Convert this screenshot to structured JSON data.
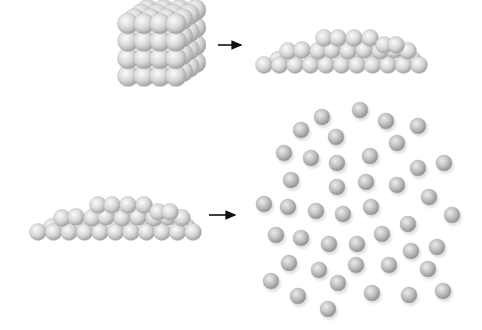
{
  "diagram": {
    "colors": {
      "background": "#ffffff",
      "sphere_light": "#f4f4f4",
      "sphere_mid": "#c8c8c8",
      "sphere_dark": "#8c8c8c",
      "arrow": "#111111"
    },
    "panels": [
      {
        "id": "solid",
        "label": "solid",
        "bbox": [
          118,
          12,
          84,
          74
        ]
      },
      {
        "id": "liquid_top",
        "label": "liquid",
        "bbox": [
          256,
          30,
          166,
          44
        ]
      },
      {
        "id": "liquid_bottom",
        "label": "liquid",
        "bbox": [
          30,
          195,
          165,
          45
        ]
      },
      {
        "id": "gas",
        "label": "gas",
        "bbox": [
          258,
          100,
          200,
          218
        ]
      }
    ],
    "arrows": [
      {
        "id": "solid-to-liquid",
        "x1": 218,
        "y1": 45,
        "x2": 245,
        "y2": 45
      },
      {
        "id": "liquid-to-gas",
        "x1": 209,
        "y1": 215,
        "x2": 239,
        "y2": 215
      }
    ],
    "gas_particles": [
      [
        322,
        117
      ],
      [
        360,
        110
      ],
      [
        386,
        121
      ],
      [
        418,
        126
      ],
      [
        301,
        130
      ],
      [
        336,
        137
      ],
      [
        397,
        143
      ],
      [
        284,
        153
      ],
      [
        311,
        158
      ],
      [
        337,
        163
      ],
      [
        370,
        156
      ],
      [
        444,
        163
      ],
      [
        418,
        168
      ],
      [
        291,
        180
      ],
      [
        337,
        187
      ],
      [
        366,
        182
      ],
      [
        397,
        185
      ],
      [
        429,
        197
      ],
      [
        264,
        204
      ],
      [
        288,
        207
      ],
      [
        316,
        211
      ],
      [
        343,
        214
      ],
      [
        371,
        207
      ],
      [
        408,
        224
      ],
      [
        452,
        215
      ],
      [
        276,
        235
      ],
      [
        301,
        238
      ],
      [
        329,
        244
      ],
      [
        357,
        244
      ],
      [
        382,
        234
      ],
      [
        411,
        251
      ],
      [
        437,
        247
      ],
      [
        289,
        263
      ],
      [
        319,
        270
      ],
      [
        356,
        265
      ],
      [
        389,
        265
      ],
      [
        428,
        269
      ],
      [
        271,
        281
      ],
      [
        298,
        296
      ],
      [
        338,
        283
      ],
      [
        372,
        293
      ],
      [
        409,
        295
      ],
      [
        443,
        291
      ],
      [
        328,
        309
      ]
    ],
    "gas_particle_radius": 8
  }
}
